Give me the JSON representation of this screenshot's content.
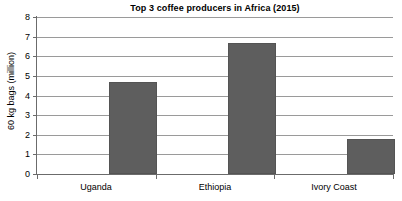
{
  "chart_data": {
    "type": "bar",
    "title": "Top 3 coffee producers in Africa (2015)",
    "categories": [
      "Uganda",
      "Ethiopia",
      "Ivory Coast"
    ],
    "values": [
      4.7,
      6.65,
      1.8
    ],
    "xlabel": "",
    "ylabel": "60 kg bags (million)",
    "ylim": [
      0,
      8
    ],
    "ytick_labels": [
      "8",
      "7",
      "6",
      "5",
      "4",
      "3",
      "2",
      "1",
      "0"
    ],
    "ytick_values": [
      8,
      7,
      6,
      5,
      4,
      3,
      2,
      1,
      0
    ],
    "grid": true,
    "legend": false,
    "bar_color": "#5e5e5e",
    "gridline_color": "#9a9a9a",
    "axis_color": "#6b6b6b",
    "background_color": "#ffffff"
  }
}
